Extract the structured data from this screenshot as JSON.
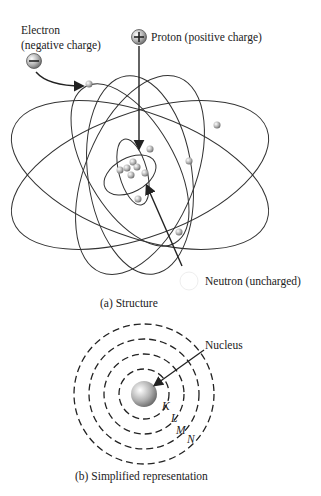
{
  "structure": {
    "electron_label_line1": "Electron",
    "electron_label_line2": "(negative charge)",
    "electron_symbol": "−",
    "proton_label": "Proton (positive charge)",
    "proton_symbol": "+",
    "neutron_label": "Neutron (uncharged)",
    "caption": "(a) Structure"
  },
  "simplified": {
    "nucleus_label": "Nucleus",
    "shells": [
      "K",
      "L",
      "M",
      "N"
    ],
    "caption": "(b) Simplified representation"
  },
  "colors": {
    "line": "#2a2a2a",
    "particle": "#b5b5b5"
  }
}
